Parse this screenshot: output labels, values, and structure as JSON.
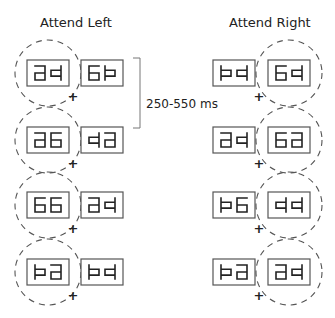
{
  "titles": {
    "left": "Attend Left",
    "right": "Attend Right"
  },
  "timing_label": "250-550 ms",
  "colors": {
    "stroke": "#222222",
    "box_stroke": "#555555",
    "circle_stroke": "#555555"
  },
  "glyph_legend": {
    "a": "mirrored-6 glyph (top, right, middle, lower-left, bottom)",
    "q": "mirrored-p glyph (right full, left box)",
    "6": "six glyph",
    "p": "p glyph (left full, right box)"
  },
  "panels": [
    {
      "name": "attend-left",
      "attended_side": "left",
      "rows": [
        {
          "left": [
            "a",
            "q"
          ],
          "right": [
            "6",
            "p"
          ]
        },
        {
          "left": [
            "a",
            "6"
          ],
          "right": [
            "q",
            "a"
          ]
        },
        {
          "left": [
            "6",
            "6"
          ],
          "right": [
            "a",
            "q"
          ]
        },
        {
          "left": [
            "p",
            "a"
          ],
          "right": [
            "p",
            "q"
          ]
        }
      ]
    },
    {
      "name": "attend-right",
      "attended_side": "right",
      "rows": [
        {
          "left": [
            "p",
            "q"
          ],
          "right": [
            "6",
            "q"
          ]
        },
        {
          "left": [
            "a",
            "q"
          ],
          "right": [
            "6",
            "a"
          ]
        },
        {
          "left": [
            "p",
            "6"
          ],
          "right": [
            "q",
            "q"
          ]
        },
        {
          "left": [
            "p",
            "a"
          ],
          "right": [
            "a",
            "q"
          ]
        }
      ]
    }
  ],
  "fixation_symbol": "+"
}
